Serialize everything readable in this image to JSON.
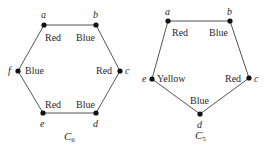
{
  "graphs": [
    {
      "id": "C6",
      "caption": "C",
      "caption_sub": "6",
      "vertices": [
        {
          "name": "a",
          "color": "Red"
        },
        {
          "name": "b",
          "color": "Blue"
        },
        {
          "name": "c",
          "color": "Red"
        },
        {
          "name": "d",
          "color": "Blue"
        },
        {
          "name": "e",
          "color": "Red"
        },
        {
          "name": "f",
          "color": "Blue"
        }
      ]
    },
    {
      "id": "C5",
      "caption": "C",
      "caption_sub": "5",
      "vertices": [
        {
          "name": "a",
          "color": "Red"
        },
        {
          "name": "b",
          "color": "Blue"
        },
        {
          "name": "c",
          "color": "Red"
        },
        {
          "name": "d",
          "color": "Blue"
        },
        {
          "name": "e",
          "color": "Yellow"
        }
      ]
    }
  ]
}
